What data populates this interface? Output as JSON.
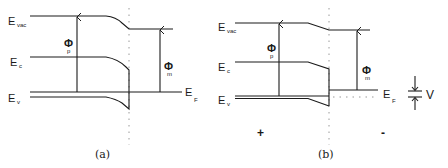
{
  "figure": {
    "panels": [
      {
        "id": "a",
        "caption": "(a)",
        "labels": {
          "e_vac": "E",
          "e_vac_sub": "vac",
          "e_c": "E",
          "e_c_sub": "c",
          "e_v": "E",
          "e_v_sub": "v",
          "phi_p": "Φ",
          "phi_p_sub": "p",
          "phi_m": "Φ",
          "phi_m_sub": "m",
          "e_f": "E",
          "e_f_sub": "F"
        }
      },
      {
        "id": "b",
        "caption": "(b)",
        "labels": {
          "e_vac": "E",
          "e_vac_sub": "vac",
          "e_c": "E",
          "e_c_sub": "c",
          "e_v": "E",
          "e_v_sub": "v",
          "phi_p": "Φ",
          "phi_p_sub": "p",
          "phi_m": "Φ",
          "phi_m_sub": "m",
          "e_f": "E",
          "e_f_sub": "F",
          "voltage": "V",
          "plus": "+",
          "minus": "-"
        }
      }
    ]
  }
}
